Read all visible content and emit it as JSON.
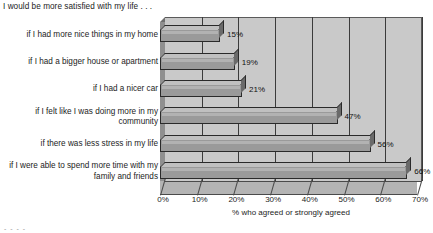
{
  "chart_data": {
    "type": "bar",
    "orientation": "horizontal",
    "title": "I would be more satisfied with my life . . .",
    "xlabel": "% who agreed or strongly agreed",
    "ylabel": "",
    "categories": [
      "if I had more nice things in my home",
      "if I had a bigger house or apartment",
      "if I had a nicer car",
      "if I felt like I was doing more in my community",
      "if there was less stress in my life",
      "if I were able to spend more time with my family and friends"
    ],
    "values": [
      15,
      19,
      21,
      47,
      56,
      66
    ],
    "data_labels": [
      "15%",
      "19%",
      "21%",
      "47%",
      "56%",
      "66%"
    ],
    "xlim": [
      0,
      70
    ],
    "xticks": [
      0,
      10,
      20,
      30,
      40,
      50,
      60,
      70
    ],
    "xtick_labels": [
      "0%",
      "10%",
      "20%",
      "30%",
      "40%",
      "50%",
      "60%",
      "70%"
    ],
    "grid": "vertical",
    "legend": "none",
    "style": "3d-bar",
    "colors": {
      "plot_background": "#c9c9c9",
      "bar_fill": "#9a9a9a",
      "bar_top_face": "#c0c0c0",
      "bar_side_face": "#6a6a6a",
      "bar_outline": "#2a2a2a",
      "gridline": "#3b3b3b",
      "floor": "#b4b4b4",
      "side_wall": "#8f8f8f",
      "text": "#1c1c1c",
      "page_background": "#ffffff"
    }
  },
  "footer": {
    "artifact": "- - - -"
  }
}
